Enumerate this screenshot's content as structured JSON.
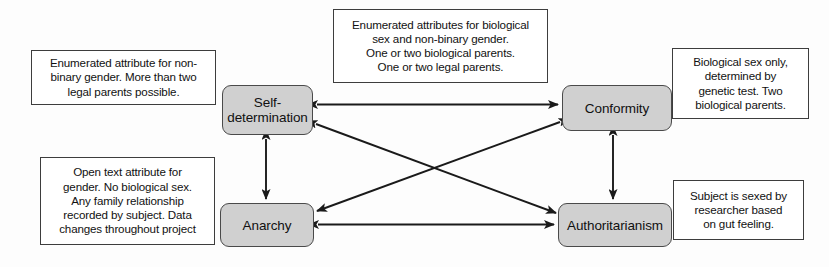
{
  "diagram": {
    "node_fill_color": "#d0d0d0",
    "node_border_color": "#4a4a4a",
    "note_fill_color": "#ffffff",
    "note_border_color": "#3d3d3d",
    "edge_color": "#1a1a1a"
  },
  "nodes": [
    {
      "id": "self-determination",
      "label": "Self-\ndetermination",
      "x": 222,
      "y": 85,
      "width": 91,
      "height": 50
    },
    {
      "id": "conformity",
      "label": "Conformity",
      "x": 562,
      "y": 85,
      "width": 110,
      "height": 46
    },
    {
      "id": "anarchy",
      "label": "Anarchy",
      "x": 220,
      "y": 203,
      "width": 94,
      "height": 44
    },
    {
      "id": "authoritarianism",
      "label": "Authoritarianism",
      "x": 558,
      "y": 203,
      "width": 114,
      "height": 44
    }
  ],
  "notes": [
    {
      "id": "note-self-determination",
      "text": "Enumerated attribute for non-\nbinary gender. More than two\nlegal parents possible.",
      "x": 31,
      "y": 50,
      "width": 185,
      "height": 55
    },
    {
      "id": "note-top-center",
      "text": "Enumerated attributes for biological\nsex and non-binary gender.\nOne or two biological parents.\nOne or two legal parents.",
      "x": 333,
      "y": 9,
      "width": 215,
      "height": 74
    },
    {
      "id": "note-conformity",
      "text": "Biological sex only,\ndetermined by\ngenetic test. Two\nbiological parents.",
      "x": 672,
      "y": 48,
      "width": 137,
      "height": 71
    },
    {
      "id": "note-anarchy",
      "text": "Open text attribute for\ngender. No biological sex.\nAny family relationship\nrecorded by subject. Data\nchanges throughout project",
      "x": 40,
      "y": 157,
      "width": 175,
      "height": 88
    },
    {
      "id": "note-authoritarianism",
      "text": "Subject is sexed by\nresearcher based\non gut feeling.",
      "x": 673,
      "y": 180,
      "width": 131,
      "height": 60
    }
  ],
  "edges": [
    {
      "id": "edge-self-determination-conformity",
      "from": "self-determination",
      "to": "conformity",
      "style": "double-headed",
      "orientation": "horizontal"
    },
    {
      "id": "edge-anarchy-authoritarianism",
      "from": "anarchy",
      "to": "authoritarianism",
      "style": "double-headed",
      "orientation": "horizontal"
    },
    {
      "id": "edge-self-determination-anarchy",
      "from": "self-determination",
      "to": "anarchy",
      "style": "double-headed",
      "orientation": "vertical"
    },
    {
      "id": "edge-conformity-authoritarianism",
      "from": "conformity",
      "to": "authoritarianism",
      "style": "double-headed",
      "orientation": "vertical"
    },
    {
      "id": "edge-self-determination-authoritarianism",
      "from": "self-determination",
      "to": "authoritarianism",
      "style": "double-headed",
      "orientation": "diagonal"
    },
    {
      "id": "edge-conformity-anarchy",
      "from": "conformity",
      "to": "anarchy",
      "style": "double-headed",
      "orientation": "diagonal"
    }
  ]
}
